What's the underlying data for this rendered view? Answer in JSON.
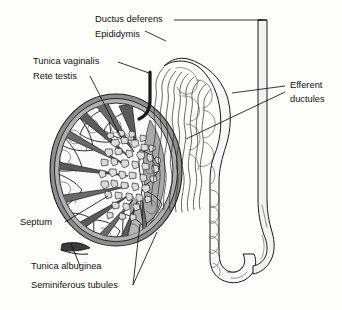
{
  "figure": {
    "background_color": "#fdfdfc",
    "line_color": "#1a1a1a"
  },
  "labels": {
    "ductus_deferens": "Ductus deferens",
    "epididymis": "Epididymis",
    "tunica_vaginalis": "Tunica vaginalis",
    "rete_testis": "Rete testis",
    "efferent_ductules_line1": "Efferent",
    "efferent_ductules_line2": "ductules",
    "septum": "Septum",
    "tunica_albuginea": "Tunica albuginea",
    "seminiferous_tubules": "Seminiferous tubules"
  },
  "structures": {
    "testis": {
      "name": "testis-cross-section",
      "capsule_outer_color": "#8a8a8a",
      "capsule_inner_color": "#b4b4b4",
      "lobule_color": "#f4f4f4",
      "mediastinum_color": "#a8a8a8",
      "lobule_count": 10
    },
    "rete_testis": {
      "name": "rete-testis-mosaic",
      "cell_count": 44,
      "fill_color": "#d9d9d9"
    },
    "efferent_ductules": {
      "name": "efferent-ductules-bundle",
      "duct_count": 9
    },
    "epididymis": {
      "name": "epididymis-body",
      "fill_color": "#f7f7f7"
    },
    "ductus_deferens": {
      "name": "ductus-deferens-tube",
      "fill_color": "#f2f2f2"
    }
  }
}
